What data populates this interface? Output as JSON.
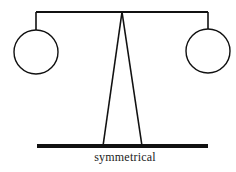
{
  "diagram": {
    "caption": "symmetrical",
    "colors": {
      "stroke": "#111111",
      "background": "#ffffff"
    },
    "beam": {
      "x1": 36,
      "x2": 208,
      "y": 12
    },
    "left_weight": {
      "cx": 36,
      "cy": 52,
      "r": 22
    },
    "right_weight": {
      "cx": 208,
      "cy": 51,
      "r": 22
    },
    "fulcrum": {
      "apex_x": 122,
      "apex_y": 12,
      "left_foot_x": 103,
      "right_foot_x": 142,
      "foot_y": 146
    },
    "base": {
      "x1": 37,
      "x2": 208,
      "y": 146,
      "thickness": 4
    }
  }
}
